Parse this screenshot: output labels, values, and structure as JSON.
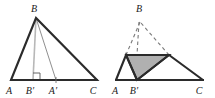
{
  "figure": {
    "caption": "Two geometric diagrams of triangle ABC with altitude and folded construction",
    "colors": {
      "stroke_dark": "#2b2b2b",
      "stroke_thin": "#8a8a8a",
      "altitude": "#b4b4b4",
      "fill_gray": "#b0b0b0",
      "dashed": "#7a7a7a",
      "background": "#ffffff",
      "label": "#1a1a1a"
    },
    "panels": [
      {
        "id": "left-panel",
        "name": "triangle-with-altitude",
        "labels": [
          {
            "key": "B",
            "text": "B",
            "x": 34,
            "y": 12
          },
          {
            "key": "A",
            "text": "A",
            "x": 9,
            "y": 94
          },
          {
            "key": "Bprime",
            "text": "B′",
            "x": 29,
            "y": 94
          },
          {
            "key": "Aprime",
            "text": "A′",
            "x": 51,
            "y": 94
          },
          {
            "key": "C",
            "text": "C",
            "x": 92,
            "y": 94
          }
        ],
        "points": {
          "A": {
            "x": 11,
            "y": 80
          },
          "B": {
            "x": 36,
            "y": 18
          },
          "C": {
            "x": 97,
            "y": 80
          },
          "Bprime": {
            "x": 33,
            "y": 80
          },
          "Aprime": {
            "x": 56,
            "y": 80
          }
        },
        "right_angle_at": "Bprime"
      },
      {
        "id": "right-panel",
        "name": "folded-triangle-shaded",
        "labels": [
          {
            "key": "B",
            "text": "B",
            "x": 137,
            "y": 12
          },
          {
            "key": "A",
            "text": "A",
            "x": 114,
            "y": 94
          },
          {
            "key": "Bprime",
            "text": "B′",
            "x": 132,
            "y": 94
          },
          {
            "key": "C",
            "text": "C",
            "x": 198,
            "y": 94
          }
        ],
        "points": {
          "A": {
            "x": 116,
            "y": 80
          },
          "B": {
            "x": 140,
            "y": 18
          },
          "C": {
            "x": 203,
            "y": 80
          },
          "Bprime": {
            "x": 137,
            "y": 80
          },
          "Pleft": {
            "x": 126,
            "y": 55
          },
          "Pright": {
            "x": 169,
            "y": 55
          }
        },
        "shaded_triangle": [
          "Pleft",
          "Pright",
          "Bprime"
        ]
      }
    ]
  }
}
